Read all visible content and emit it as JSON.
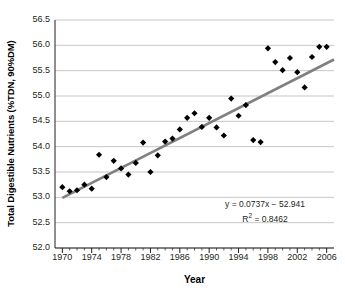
{
  "chart_data": {
    "type": "scatter",
    "title": "",
    "xlabel": "Year",
    "ylabel": "Total Digestible Nutrients (%TDN, 90%DM)",
    "xlim": [
      1969,
      2007
    ],
    "ylim": [
      52.0,
      56.5
    ],
    "yticks": [
      "56.5",
      "56.0",
      "55.5",
      "55.0",
      "54.5",
      "54.0",
      "53.5",
      "53.0",
      "52.5",
      "52.0"
    ],
    "ytick_values": [
      56.5,
      56.0,
      55.5,
      55.0,
      54.5,
      54.0,
      53.5,
      53.0,
      52.5,
      52.0
    ],
    "xticks": [
      "1970",
      "1974",
      "1978",
      "1982",
      "1986",
      "1990",
      "1994",
      "1998",
      "2002",
      "2006"
    ],
    "xtick_values": [
      1970,
      1974,
      1978,
      1982,
      1986,
      1990,
      1994,
      1998,
      2002,
      2006
    ],
    "xtick_minor_step": 1,
    "grid": "horizontal",
    "legend": "none",
    "marker": "diamond",
    "marker_color": "#000000",
    "trendline_color": "#808080",
    "gridline_color": "#b7b7b7",
    "x": [
      1970,
      1971,
      1972,
      1973,
      1974,
      1975,
      1976,
      1977,
      1978,
      1979,
      1980,
      1981,
      1982,
      1983,
      1984,
      1985,
      1986,
      1987,
      1988,
      1989,
      1990,
      1991,
      1992,
      1993,
      1994,
      1995,
      1996,
      1997,
      1998,
      1999,
      2000,
      2001,
      2002,
      2003,
      2004,
      2005,
      2006
    ],
    "y": [
      53.2,
      53.12,
      53.14,
      53.25,
      53.17,
      53.84,
      53.4,
      53.72,
      53.57,
      53.45,
      53.68,
      54.08,
      53.5,
      53.83,
      54.1,
      54.16,
      54.34,
      54.57,
      54.66,
      54.39,
      54.57,
      54.38,
      54.22,
      54.95,
      54.61,
      54.82,
      54.13,
      54.09,
      55.94,
      55.67,
      55.51,
      55.75,
      55.47,
      55.17,
      55.77,
      55.97,
      55.97
    ],
    "trendline": {
      "equation": "y = 0.0737x − 52.941",
      "r2_label": "R² = 0.8462",
      "r2_prefix": "R",
      "r2_sup": "2",
      "r2_suffix": " = 0.8462",
      "slope": 0.0737,
      "intercept": -52.941,
      "r2": 0.8462,
      "x_start": 1970,
      "x_end": 2007,
      "y_start": 52.99,
      "y_end": 55.72
    }
  }
}
